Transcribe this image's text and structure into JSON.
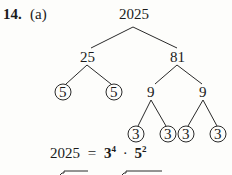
{
  "problem": {
    "number": "14.",
    "part": "(a)"
  },
  "tree": {
    "root": "2025",
    "level1": [
      "25",
      "81"
    ],
    "level2": [
      "5",
      "5",
      "9",
      "9"
    ],
    "level2_circled": [
      true,
      true,
      false,
      false
    ],
    "level3": [
      "3",
      "3",
      "3",
      "3"
    ],
    "level3_circled": [
      true,
      true,
      true,
      true
    ]
  },
  "equation": {
    "lhs": "2025",
    "equals": "=",
    "base1": "3",
    "exp1": "4",
    "dot": "·",
    "base2": "5",
    "exp2": "2"
  }
}
